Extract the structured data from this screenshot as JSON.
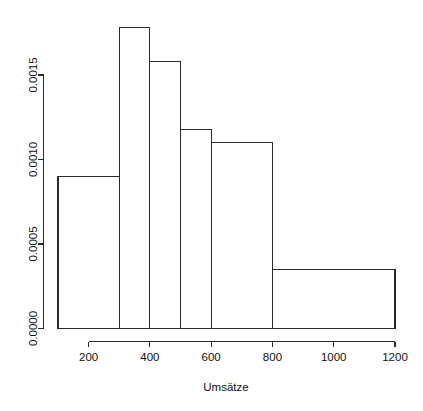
{
  "chart_data": {
    "type": "bar",
    "subtype": "histogram",
    "title": "",
    "subtitle": "",
    "xlabel": "Umsätze",
    "ylabel": "",
    "grid": false,
    "legend": false,
    "legend_position": "none",
    "xlim": [
      100,
      1200
    ],
    "ylim": [
      0.0,
      0.0018
    ],
    "xticks": [
      200,
      400,
      600,
      800,
      1000,
      1200
    ],
    "xtick_labels": [
      "200",
      "400",
      "600",
      "800",
      "1000",
      "1200"
    ],
    "yticks": [
      0.0,
      0.0005,
      0.001,
      0.0015
    ],
    "ytick_labels": [
      "0.0000",
      "0.0005",
      "0.0010",
      "0.0015"
    ],
    "bin_edges": [
      100,
      300,
      400,
      500,
      600,
      800,
      1200
    ],
    "bins": [
      {
        "label": "100-300",
        "x0": 100,
        "x1": 300,
        "density": 0.0009
      },
      {
        "label": "300-400",
        "x0": 300,
        "x1": 400,
        "density": 0.00178
      },
      {
        "label": "400-500",
        "x0": 400,
        "x1": 500,
        "density": 0.00158
      },
      {
        "label": "500-600",
        "x0": 500,
        "x1": 600,
        "density": 0.00118
      },
      {
        "label": "600-800",
        "x0": 600,
        "x1": 800,
        "density": 0.0011
      },
      {
        "label": "800-1200",
        "x0": 800,
        "x1": 1200,
        "density": 0.00035
      }
    ],
    "categories": [
      "100-300",
      "300-400",
      "400-500",
      "500-600",
      "600-800",
      "800-1200"
    ],
    "values": [
      0.0009,
      0.00178,
      0.00158,
      0.00118,
      0.0011,
      0.00035
    ],
    "colors": {
      "bar_fill": "#ffffff",
      "bar_stroke": "#2b2b2b",
      "axis": "#2b2b2b",
      "text": "#111111",
      "background": "#ffffff"
    }
  }
}
